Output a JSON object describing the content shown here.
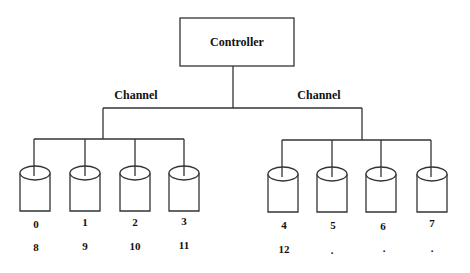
{
  "controller": {
    "label": "Controller"
  },
  "channels": [
    {
      "label": "Channel",
      "disks": [
        {
          "id": "0",
          "second": "8"
        },
        {
          "id": "1",
          "second": "9"
        },
        {
          "id": "2",
          "second": "10"
        },
        {
          "id": "3",
          "second": "11"
        }
      ]
    },
    {
      "label": "Channel",
      "disks": [
        {
          "id": "4",
          "second": "12"
        },
        {
          "id": "5",
          "second": "."
        },
        {
          "id": "6",
          "second": "."
        },
        {
          "id": "7",
          "second": "."
        }
      ]
    }
  ],
  "colors": {
    "line": "#333333",
    "text": "#111111",
    "background": "#ffffff"
  }
}
